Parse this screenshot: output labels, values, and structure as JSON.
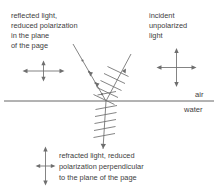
{
  "figure": {
    "title_present": false,
    "background_color": "#ffffff",
    "line_color": "#6e6e6e",
    "text_color": "#3d3d3d",
    "interface_color": "#555555"
  },
  "labels": {
    "reflected": {
      "line1": "reflected light,",
      "line2": "reduced polarization",
      "line3": "in the plane",
      "line4": "of the page"
    },
    "incident": {
      "line1": "incident",
      "line2": "unpolarized",
      "line3": "light"
    },
    "refracted": {
      "line1": "refracted light, reduced",
      "line2": "polarization perpendicular",
      "line3": "to the plane of the page"
    },
    "medium_above": "air",
    "medium_below": "water"
  },
  "symbols": {
    "reflected_polarization": "horizontal-dominant-cross-arrows",
    "incident_polarization": "equal-cross-arrows",
    "refracted_polarization": "vertical-dominant-cross-arrows"
  },
  "rays": {
    "incident": {
      "name": "incident-ray",
      "from_x": 131,
      "from_y": 54,
      "to_x": 106,
      "to_y": 101,
      "polarization_marks": "ticks"
    },
    "reflected": {
      "name": "reflected-ray",
      "from_x": 106,
      "from_y": 101,
      "to_x": 73,
      "to_y": 44,
      "polarization_marks": "dots"
    },
    "refracted": {
      "name": "refracted-ray",
      "from_x": 106,
      "from_y": 101,
      "to_x": 103,
      "to_y": 149,
      "polarization_marks": "ticks"
    },
    "interface_y": 101
  }
}
